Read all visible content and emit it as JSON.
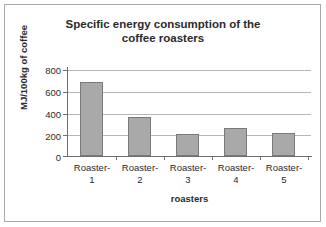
{
  "chart_data": {
    "type": "bar",
    "title": "Specific energy consumption of the coffee roasters",
    "title_line1": "Specific energy consumption of the",
    "title_line2": "coffee roasters",
    "xlabel": "roasters",
    "ylabel": "MJ/100kg of coffee",
    "categories": [
      "Roaster-1",
      "Roaster-2",
      "Roaster-3",
      "Roaster-4",
      "Roaster-5"
    ],
    "category_lines": [
      {
        "line1": "Roaster-",
        "line2": "1"
      },
      {
        "line1": "Roaster-",
        "line2": "2"
      },
      {
        "line1": "Roaster-",
        "line2": "3"
      },
      {
        "line1": "Roaster-",
        "line2": "4"
      },
      {
        "line1": "Roaster-",
        "line2": "5"
      }
    ],
    "values": [
      670,
      350,
      195,
      250,
      210
    ],
    "ylim": [
      0,
      800
    ],
    "yticks": [
      800,
      600,
      400,
      200,
      0
    ],
    "ytick_labels": [
      "800",
      "600",
      "400",
      "200",
      "0"
    ],
    "grid": true,
    "legend": "none",
    "bar_color": "#a9a9a9",
    "bar_border_color": "#7a7a7a",
    "gridline_color": "#b6b6b6",
    "axis_color": "#6e6e6e",
    "text_color": "#2b2b2b",
    "frame_color": "#a9a9a9",
    "background": "#ffffff"
  }
}
